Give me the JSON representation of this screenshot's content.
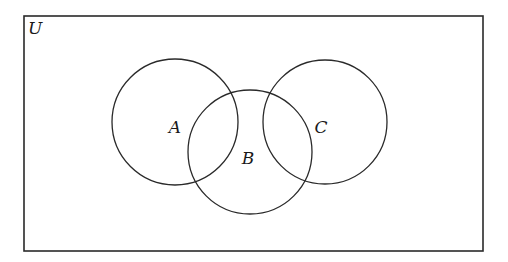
{
  "diagram": {
    "type": "venn",
    "universe": {
      "label": "U",
      "x": 24,
      "y": 16,
      "width": 459,
      "height": 235
    },
    "sets": [
      {
        "label": "A",
        "cx": 175,
        "cy": 122,
        "r": 63,
        "label_x": 175,
        "label_y": 133
      },
      {
        "label": "B",
        "cx": 250,
        "cy": 152,
        "r": 62,
        "label_x": 248,
        "label_y": 164
      },
      {
        "label": "C",
        "cx": 325,
        "cy": 122,
        "r": 62,
        "label_x": 321,
        "label_y": 133
      }
    ],
    "stroke_color": "#2a2a2a",
    "background": "#ffffff"
  }
}
